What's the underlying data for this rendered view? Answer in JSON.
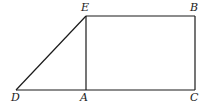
{
  "diagram": {
    "type": "geometry",
    "points": [
      {
        "id": "E",
        "label": "E",
        "x": 86,
        "y": 16,
        "label_x": 81,
        "label_y": 11
      },
      {
        "id": "B",
        "label": "B",
        "x": 195,
        "y": 16,
        "label_x": 190,
        "label_y": 11
      },
      {
        "id": "D",
        "label": "D",
        "x": 16,
        "y": 90,
        "label_x": 11,
        "label_y": 101
      },
      {
        "id": "A",
        "label": "A",
        "x": 86,
        "y": 90,
        "label_x": 80,
        "label_y": 101
      },
      {
        "id": "C",
        "label": "C",
        "x": 195,
        "y": 90,
        "label_x": 190,
        "label_y": 101
      }
    ],
    "segments": [
      {
        "from": "D",
        "to": "E"
      },
      {
        "from": "E",
        "to": "B"
      },
      {
        "from": "B",
        "to": "C"
      },
      {
        "from": "D",
        "to": "C"
      },
      {
        "from": "E",
        "to": "A"
      }
    ],
    "line_color": "#1a1a1a"
  }
}
